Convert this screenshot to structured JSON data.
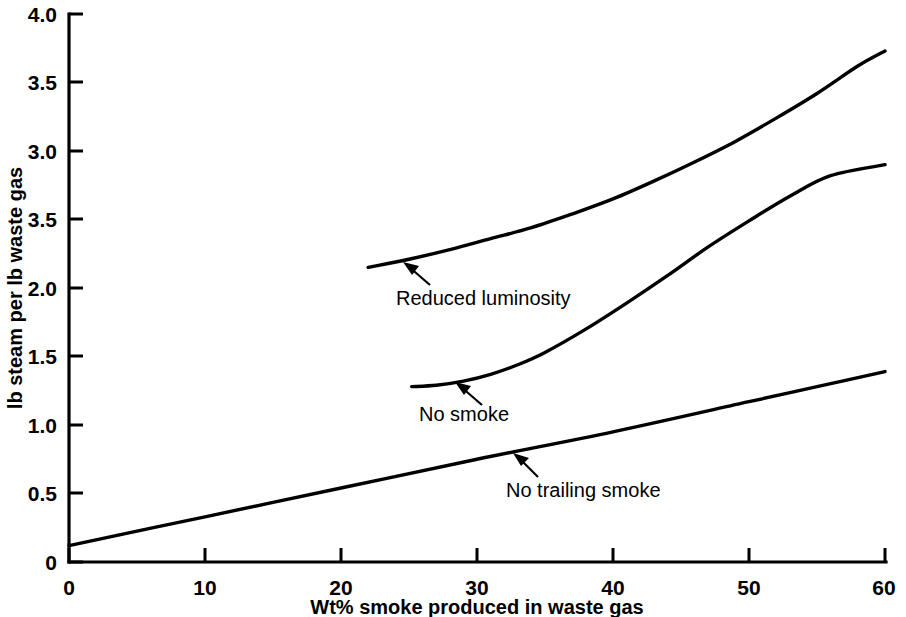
{
  "chart_data": {
    "type": "line",
    "title": "",
    "subtitle": "",
    "xlabel": "Wt% smoke produced in waste gas",
    "ylabel": "lb steam per lb waste gas",
    "xlim": [
      0,
      60
    ],
    "ylim": [
      0,
      4.0
    ],
    "grid": false,
    "legend_position": "inline-annotations",
    "xticks": [
      0,
      10,
      20,
      30,
      40,
      50,
      60
    ],
    "xtick_labels": [
      "0",
      "10",
      "20",
      "30",
      "40",
      "50",
      "60"
    ],
    "yticks": [
      0,
      0.5,
      1.0,
      1.5,
      2.0,
      2.5,
      3.0,
      3.5,
      4.0
    ],
    "ytick_labels": [
      "0",
      "0.5",
      "1.0",
      "1.5",
      "2.0",
      "3.5",
      "3.0",
      "3.5",
      "4.0"
    ],
    "ytick_note": "The tick at value 2.5 is printed as '3.5' in the original figure.",
    "series": [
      {
        "name": "Reduced luminosity",
        "annotation": "Reduced luminosity",
        "x": [
          22.0,
          25.0,
          28.0,
          31.0,
          34.0,
          37.0,
          40.0,
          43.0,
          46.0,
          49.0,
          52.0,
          55.0,
          58.0,
          60.0
        ],
        "y": [
          2.15,
          2.21,
          2.28,
          2.36,
          2.44,
          2.54,
          2.65,
          2.78,
          2.92,
          3.07,
          3.24,
          3.42,
          3.62,
          3.73
        ]
      },
      {
        "name": "No smoke",
        "annotation": "No smoke",
        "x": [
          25.2,
          27.0,
          29.0,
          31.0,
          33.0,
          35.0,
          38.0,
          41.0,
          44.0,
          47.0,
          50.0,
          53.0,
          56.0,
          60.0
        ],
        "y": [
          1.28,
          1.29,
          1.32,
          1.37,
          1.44,
          1.53,
          1.7,
          1.89,
          2.09,
          2.3,
          2.49,
          2.67,
          2.82,
          2.9
        ]
      },
      {
        "name": "No trailing smoke",
        "annotation": "No trailing smoke",
        "x": [
          0.0,
          10.0,
          20.0,
          30.0,
          40.0,
          50.0,
          55.0,
          60.0
        ],
        "y": [
          0.12,
          0.33,
          0.54,
          0.75,
          0.95,
          1.17,
          1.28,
          1.39
        ]
      }
    ],
    "annotations": [
      {
        "id": "reduced-luminosity",
        "text": "Reduced luminosity",
        "points_to": {
          "x": 25.1,
          "y": 2.21
        }
      },
      {
        "id": "no-smoke",
        "text": "No smoke",
        "points_to": {
          "x": 29.0,
          "y": 1.32
        }
      },
      {
        "id": "no-trailing-smoke",
        "text": "No trailing smoke",
        "points_to": {
          "x": 33.0,
          "y": 0.81
        }
      }
    ],
    "colors": {
      "curve": "#000000",
      "axis": "#000000",
      "text": "#000000",
      "background": "#ffffff"
    }
  }
}
